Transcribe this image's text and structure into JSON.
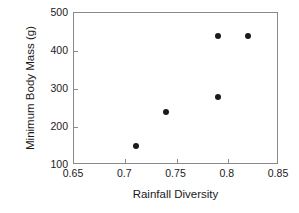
{
  "chart_data": {
    "type": "scatter",
    "title": "",
    "xlabel": "Rainfall Diversity",
    "ylabel": "Minimum Body Mass (g)",
    "xlim": [
      0.65,
      0.85
    ],
    "ylim": [
      100,
      500
    ],
    "xticks": [
      0.65,
      0.7,
      0.75,
      0.8,
      0.85
    ],
    "xtick_labels": [
      "0.65",
      "0.7",
      "0.75",
      "0.8",
      "0.85"
    ],
    "yticks": [
      100,
      200,
      300,
      400,
      500
    ],
    "ytick_labels": [
      "100",
      "200",
      "300",
      "400",
      "500"
    ],
    "grid": false,
    "legend": null,
    "marker": "filled-circle",
    "marker_color": "#1a1a1a",
    "frame_color": "#8a8a8a",
    "series": [
      {
        "name": "",
        "points": [
          {
            "x": 0.71,
            "y": 150
          },
          {
            "x": 0.74,
            "y": 240
          },
          {
            "x": 0.79,
            "y": 280
          },
          {
            "x": 0.79,
            "y": 440
          },
          {
            "x": 0.82,
            "y": 440
          }
        ]
      }
    ]
  }
}
